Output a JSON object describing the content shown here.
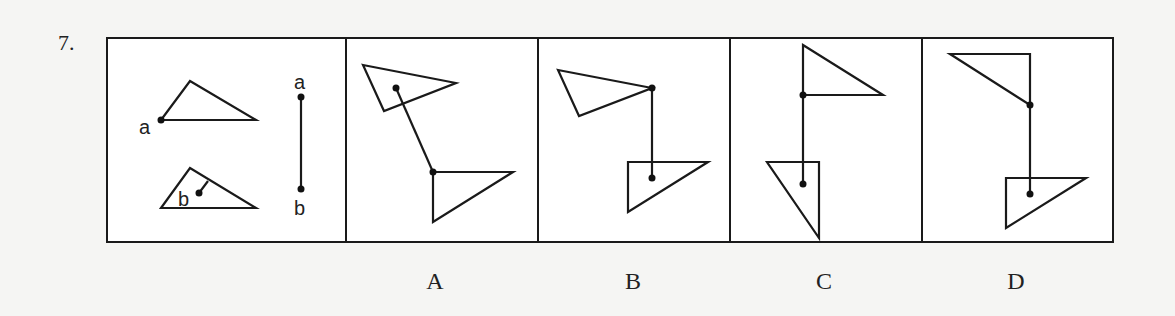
{
  "question": {
    "number": "7."
  },
  "reference_panel": {
    "triangle_top_label": "a",
    "triangle_bottom_label": "b",
    "segment_top_label": "a",
    "segment_bottom_label": "b"
  },
  "options": [
    {
      "label": "A"
    },
    {
      "label": "B"
    },
    {
      "label": "C"
    },
    {
      "label": "D"
    }
  ],
  "colors": {
    "ink": "#1a1a1a",
    "paper": "#ffffff",
    "background": "#f5f5f3"
  }
}
